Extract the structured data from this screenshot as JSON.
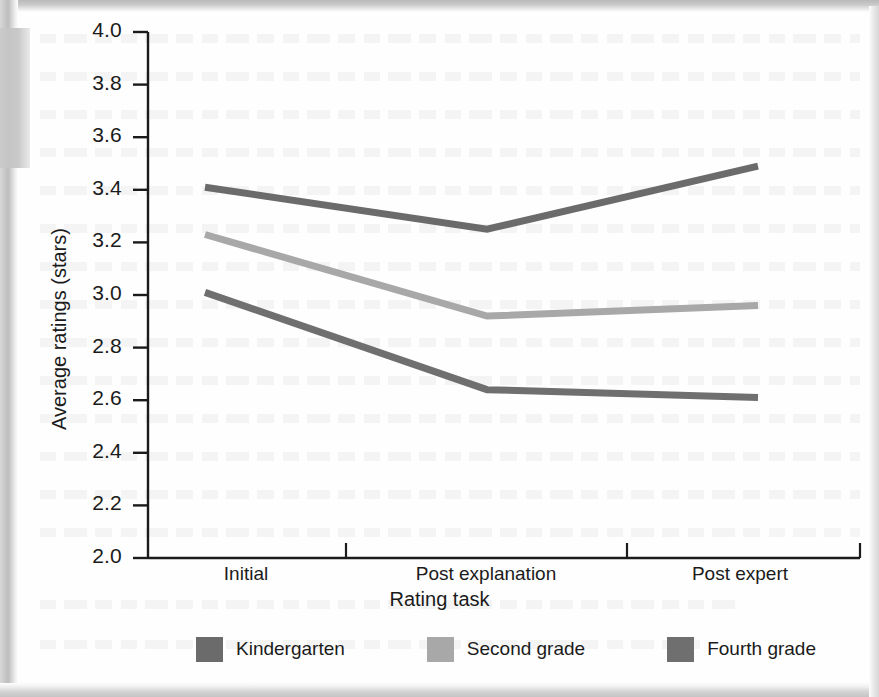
{
  "figure": {
    "background_color": "#fefefe",
    "axis_color": "#1b1b1b"
  },
  "chart_data": {
    "type": "line",
    "title": "",
    "xlabel": "Rating task",
    "ylabel": "Average ratings (stars)",
    "categories": [
      "Initial",
      "Post explanation",
      "Post expert"
    ],
    "ylim": [
      2.0,
      4.0
    ],
    "ytick_labels": [
      "4.0",
      "3.8",
      "3.6",
      "3.4",
      "3.2",
      "3.0",
      "2.8",
      "2.6",
      "2.4",
      "2.2",
      "2.0"
    ],
    "ytick_values": [
      4.0,
      3.8,
      3.6,
      3.4,
      3.2,
      3.0,
      2.8,
      2.6,
      2.4,
      2.2,
      2.0
    ],
    "grid": false,
    "legend_position": "bottom",
    "series": [
      {
        "name": "Kindergarten",
        "color": "#6b6b6b",
        "values": [
          3.41,
          3.25,
          3.49
        ]
      },
      {
        "name": "Second grade",
        "color": "#a8a8a8",
        "values": [
          3.23,
          2.92,
          2.96
        ]
      },
      {
        "name": "Fourth grade",
        "color": "#6f6f6f",
        "values": [
          3.01,
          2.64,
          2.61
        ]
      }
    ]
  }
}
